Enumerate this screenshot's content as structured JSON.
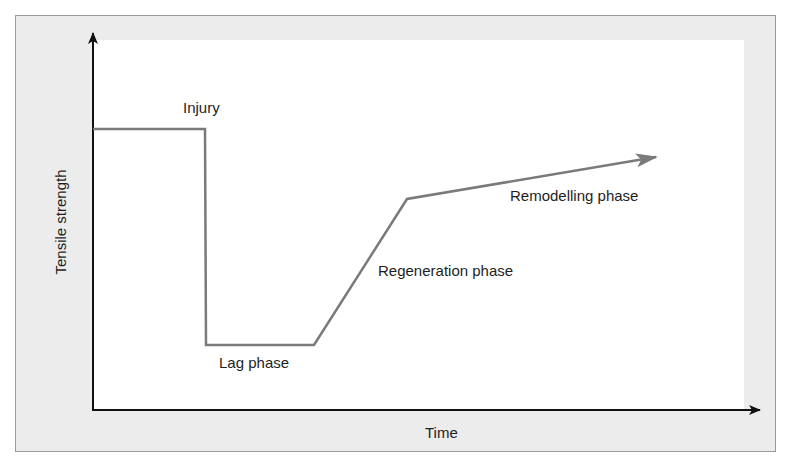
{
  "figure": {
    "type": "diagram"
  },
  "axes": {
    "x_label": "Time",
    "y_label": "Tensile strength"
  },
  "annotations": {
    "injury": "Injury",
    "lag": "Lag phase",
    "regeneration": "Regeneration phase",
    "remodelling": "Remodelling phase"
  },
  "curve": {
    "points": [
      [
        93,
        129
      ],
      [
        205,
        129
      ],
      [
        206,
        345
      ],
      [
        314,
        345
      ],
      [
        407,
        199
      ],
      [
        658,
        157
      ]
    ],
    "color": "#7a7a7a"
  },
  "colors": {
    "frame_fill": "#ececec",
    "frame_border": "#9a9a9a",
    "axis": "#111111",
    "curve": "#7a7a7a",
    "text": "#1e1e1e"
  }
}
